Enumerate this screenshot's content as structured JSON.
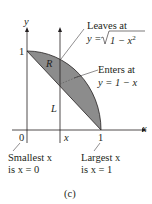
{
  "figure": {
    "caption": "(c)",
    "axes": {
      "x_label": "x",
      "y_label": "y",
      "origin_label": "0",
      "x_tick_1": "1",
      "y_tick_1": "1",
      "x_marker": "x"
    },
    "region_label": "R",
    "line_label": "L",
    "annotations": {
      "leaves_line1": "Leaves at",
      "leaves_line2_prefix": "y = ",
      "leaves_radicand": "1 − x",
      "leaves_exp": "2",
      "enters_line1": "Enters at",
      "enters_line2": "y = 1 − x",
      "smallest_line1": "Smallest x",
      "smallest_line2": "is x = 0",
      "largest_line1": "Largest x",
      "largest_line2": "is x = 1"
    },
    "colors": {
      "region_fill": "#8c8c8c",
      "stroke": "#231f20"
    }
  }
}
